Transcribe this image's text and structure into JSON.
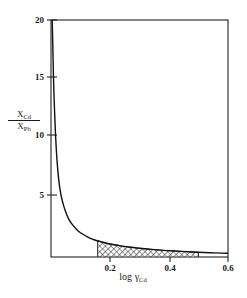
{
  "chart_data": {
    "type": "line",
    "title": "",
    "subtitle": "",
    "xlabel": "log γCd",
    "xlabel_parts": {
      "prefix": "log ",
      "symbol": "γ",
      "subscript": "Cd"
    },
    "ylabel": "XCd / XPb",
    "ylabel_parts": {
      "numerator_base": "X",
      "numerator_sub": "Cd",
      "denominator_base": "X",
      "denominator_sub": "Pb"
    },
    "xlim": [
      0.0,
      0.6
    ],
    "ylim": [
      0.0,
      20.0
    ],
    "xticks": [
      0.2,
      0.4,
      0.6
    ],
    "xtick_labels": [
      "0.2",
      "0.4",
      "0.6"
    ],
    "yticks": [
      5,
      10,
      15,
      20
    ],
    "ytick_labels": [
      "5",
      "10",
      "15",
      "20"
    ],
    "grid": false,
    "legend": null,
    "line_color": "#111111",
    "frame_color": "#222222",
    "background": "#ffffff",
    "series": [
      {
        "name": "XCd/XPb vs log gamma-Cd",
        "x": [
          0.004,
          0.006,
          0.008,
          0.01,
          0.013,
          0.016,
          0.02,
          0.025,
          0.03,
          0.036,
          0.042,
          0.05,
          0.06,
          0.072,
          0.086,
          0.1,
          0.12,
          0.14,
          0.16,
          0.185,
          0.21,
          0.24,
          0.27,
          0.3,
          0.34,
          0.38,
          0.42,
          0.46,
          0.5,
          0.54,
          0.58,
          0.6
        ],
        "y": [
          20.0,
          18.0,
          15.6,
          13.8,
          11.7,
          10.0,
          8.3,
          6.8,
          5.8,
          5.0,
          4.4,
          3.8,
          3.2,
          2.75,
          2.35,
          2.05,
          1.75,
          1.5,
          1.35,
          1.18,
          1.05,
          0.92,
          0.82,
          0.74,
          0.64,
          0.56,
          0.5,
          0.45,
          0.4,
          0.36,
          0.33,
          0.31
        ]
      }
    ],
    "shaded_region": {
      "name": "hatched-area",
      "hatch": "diagonal-crosshatch",
      "x_start": 0.158,
      "x_end": 0.5,
      "y_baseline": 0,
      "description": "hatched area between curve and x-axis from log gamma-Cd = 0.158 to 0.50"
    }
  },
  "axes": {
    "ytick_positions_px": [
      195,
      135,
      77,
      20
    ],
    "xtick_positions_px": [
      110,
      170,
      228
    ],
    "frame_px": {
      "left": 51,
      "right": 228,
      "top": 20,
      "bottom": 257
    }
  }
}
